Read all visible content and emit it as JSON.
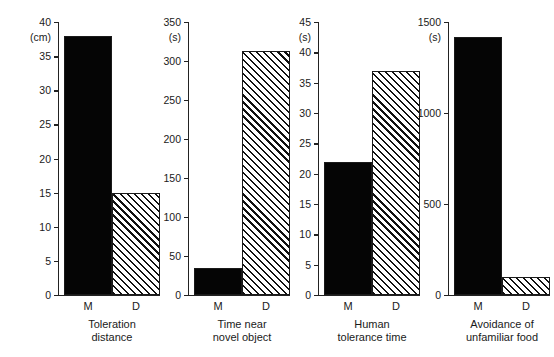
{
  "figure": {
    "background": "#ffffff",
    "ink_color": "#1a1a1a",
    "solid_fill": "#050505",
    "hatch_fill": "#ffffff",
    "group_labels": [
      "M",
      "D"
    ]
  },
  "chart_data": [
    {
      "type": "bar",
      "title": "Toleration\ndistance",
      "caption_line1": "Toleration",
      "caption_line2": "distance",
      "ylabel": "(cm)",
      "xlabel": "",
      "categories": [
        "M",
        "D"
      ],
      "values": [
        38,
        15
      ],
      "ylim": [
        0,
        40
      ],
      "yticks": [
        0,
        5,
        10,
        15,
        20,
        25,
        30,
        35,
        40
      ],
      "ytick_labels": [
        "0",
        "5",
        "10",
        "15",
        "20",
        "25",
        "30",
        "35",
        "40"
      ],
      "bar_styles": [
        "solid",
        "hatch"
      ],
      "grid": false,
      "legend": "none"
    },
    {
      "type": "bar",
      "title": "Time near\nnovel object",
      "caption_line1": "Time near",
      "caption_line2": "novel object",
      "ylabel": "(s)",
      "xlabel": "",
      "categories": [
        "M",
        "D"
      ],
      "values": [
        35,
        313
      ],
      "ylim": [
        0,
        350
      ],
      "yticks": [
        0,
        50,
        100,
        150,
        200,
        250,
        300,
        350
      ],
      "ytick_labels": [
        "0",
        "50",
        "100",
        "150",
        "200",
        "250",
        "300",
        "350"
      ],
      "bar_styles": [
        "solid",
        "hatch"
      ],
      "grid": false,
      "legend": "none"
    },
    {
      "type": "bar",
      "title": "Human\ntolerance time",
      "caption_line1": "Human",
      "caption_line2": "tolerance time",
      "ylabel": "(s)",
      "xlabel": "",
      "categories": [
        "M",
        "D"
      ],
      "values": [
        22,
        37
      ],
      "ylim": [
        0,
        45
      ],
      "yticks": [
        0,
        5,
        10,
        15,
        20,
        25,
        30,
        35,
        40,
        45
      ],
      "ytick_labels": [
        "0",
        "5",
        "10",
        "15",
        "20",
        "25",
        "30",
        "35",
        "40",
        "45"
      ],
      "bar_styles": [
        "solid",
        "hatch"
      ],
      "grid": false,
      "legend": "none"
    },
    {
      "type": "bar",
      "title": "Avoidance of\nunfamiliar food",
      "caption_line1": "Avoidance of",
      "caption_line2": "unfamiliar food",
      "ylabel": "(s)",
      "xlabel": "",
      "categories": [
        "M",
        "D"
      ],
      "values": [
        1420,
        100
      ],
      "ylim": [
        0,
        1500
      ],
      "yticks": [
        0,
        500,
        1000,
        1500
      ],
      "ytick_labels": [
        "0",
        "500",
        "1000",
        "1500"
      ],
      "bar_styles": [
        "solid",
        "hatch"
      ],
      "grid": false,
      "legend": "none"
    }
  ]
}
